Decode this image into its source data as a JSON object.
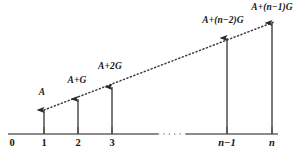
{
  "figure": {
    "type": "cash-flow-diagram",
    "caption": ""
  },
  "colors": {
    "axis": "#8c8c8c",
    "arrow": "#2b2b2b",
    "gradient_line": "#3d3d3d",
    "text": "#161616",
    "background": "#ffffff"
  },
  "axis": {
    "name": "period-axis",
    "y": 134,
    "x_start": 8,
    "x_end": 278,
    "break_start": 158,
    "break_end": 186,
    "tick_height": 7,
    "ticks": [
      {
        "label": "0",
        "x": 12,
        "italic": false,
        "has_tick_mark": false
      },
      {
        "label": "1",
        "x": 44,
        "italic": false,
        "has_tick_mark": true
      },
      {
        "label": "2",
        "x": 78,
        "italic": false,
        "has_tick_mark": true
      },
      {
        "label": "3",
        "x": 112,
        "italic": false,
        "has_tick_mark": true
      },
      {
        "label": "n−1",
        "x": 227,
        "italic": true,
        "has_tick_mark": true
      },
      {
        "label": "n",
        "x": 272,
        "italic": true,
        "has_tick_mark": true
      }
    ],
    "label_y": 138
  },
  "gradient_line": {
    "name": "gradient-trend-line",
    "x1": 44,
    "y1": 110,
    "x2": 274,
    "y2": 22,
    "style": "dotted"
  },
  "arrows": [
    {
      "name": "cashflow-arrow-1",
      "x": 44,
      "y_top": 110,
      "period": "1"
    },
    {
      "name": "cashflow-arrow-2",
      "x": 78,
      "y_top": 99,
      "period": "2"
    },
    {
      "name": "cashflow-arrow-3",
      "x": 112,
      "y_top": 87,
      "period": "3"
    },
    {
      "name": "cashflow-arrow-n-1",
      "x": 227,
      "y_top": 38,
      "period": "n−1"
    },
    {
      "name": "cashflow-arrow-n",
      "x": 272,
      "y_top": 23,
      "period": "n"
    }
  ],
  "value_labels": [
    {
      "name": "value-label-A",
      "text": "A",
      "x": 42,
      "y": 88,
      "align": "center"
    },
    {
      "name": "value-label-A-plus-G",
      "text": "A+G",
      "x": 77,
      "y": 76,
      "align": "center"
    },
    {
      "name": "value-label-A-plus-2G",
      "text": "A+2G",
      "x": 110,
      "y": 62,
      "align": "center"
    },
    {
      "name": "value-label-A-plus-n-2-G",
      "text": "A+(n−2)G",
      "x": 223,
      "y": 16,
      "align": "center"
    },
    {
      "name": "value-label-A-plus-n-1-G",
      "text": "A+(n−1)G",
      "x": 272,
      "y": 3,
      "align": "center"
    }
  ]
}
